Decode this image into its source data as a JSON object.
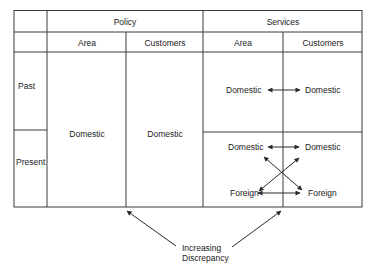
{
  "table": {
    "groups": [
      {
        "label": "Policy",
        "columns": [
          "Area",
          "Customers"
        ]
      },
      {
        "label": "Services",
        "columns": [
          "Area",
          "Customers"
        ]
      }
    ],
    "rows": [
      "Past",
      "Present"
    ],
    "policy": {
      "area_value": "Domestic",
      "customers_value": "Domestic"
    },
    "services": {
      "past": {
        "area": "Domestic",
        "customers": "Domestic",
        "relation": "bidirectional"
      },
      "present": {
        "area": [
          "Domestic",
          "Foreign"
        ],
        "customers": [
          "Domestic",
          "Foreign"
        ],
        "relation": "bidirectional-cross"
      }
    }
  },
  "annotation": {
    "line1": "Increasing",
    "line2": "Discrepancy",
    "targets": [
      "policy-area-customers-divider",
      "services-area-customers-divider"
    ]
  },
  "colors": {
    "line": "#3a3a3a",
    "text": "#1a1a1a",
    "background": "#ffffff"
  }
}
